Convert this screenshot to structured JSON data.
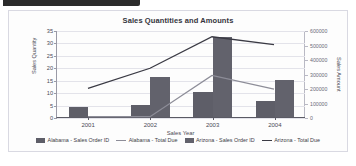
{
  "topbar": {
    "present": true
  },
  "chart_data": {
    "type": "bar",
    "title": "Sales Quantities and Amounts",
    "xlabel": "Sales Year",
    "ylabel": "Sales Quantity",
    "ylabel_right": "Sales Amount",
    "categories": [
      "2001",
      "2002",
      "2003",
      "2004"
    ],
    "ylim": [
      0,
      35
    ],
    "yticks": [
      0,
      5,
      10,
      15,
      20,
      25,
      30,
      35
    ],
    "ytick_labels": [
      "0",
      "5",
      "10",
      "15",
      "20",
      "25",
      "30",
      "35"
    ],
    "ylim_right": [
      0,
      600000
    ],
    "yticks_right": [
      0,
      100000,
      200000,
      300000,
      400000,
      500000,
      600000
    ],
    "ytick_labels_right": [
      "0",
      "100000",
      "200000",
      "300000",
      "400000",
      "500000",
      "600000"
    ],
    "grid": true,
    "legend_position": "bottom",
    "series": [
      {
        "name": "Alabama - Sales Order ID",
        "type": "bar",
        "axis": "left",
        "color": "#5e5e68",
        "values": [
          4,
          5,
          10,
          6.5
        ]
      },
      {
        "name": "Alabama - Total Due",
        "type": "line",
        "axis": "right",
        "color": "#8d8d98",
        "values": [
          2000,
          2000,
          290000,
          195000
        ]
      },
      {
        "name": "Arizona - Sales Order ID",
        "type": "bar",
        "axis": "left",
        "color": "#62626c",
        "values": [
          0,
          16,
          32,
          15
        ]
      },
      {
        "name": "Arizona - Total Due",
        "type": "line",
        "axis": "right",
        "color": "#3a3a44",
        "values": [
          200000,
          340000,
          560000,
          505000
        ]
      }
    ],
    "legend": [
      {
        "label": "Alabama - Sales Order ID",
        "marker": "bar",
        "color": "#5e5e68"
      },
      {
        "label": "Alabama - Total Due",
        "marker": "line",
        "color": "#8d8d98"
      },
      {
        "label": "Arizona - Sales Order ID",
        "marker": "bar",
        "color": "#62626c"
      },
      {
        "label": "Arizona - Total Due",
        "marker": "line",
        "color": "#3a3a44"
      }
    ]
  }
}
